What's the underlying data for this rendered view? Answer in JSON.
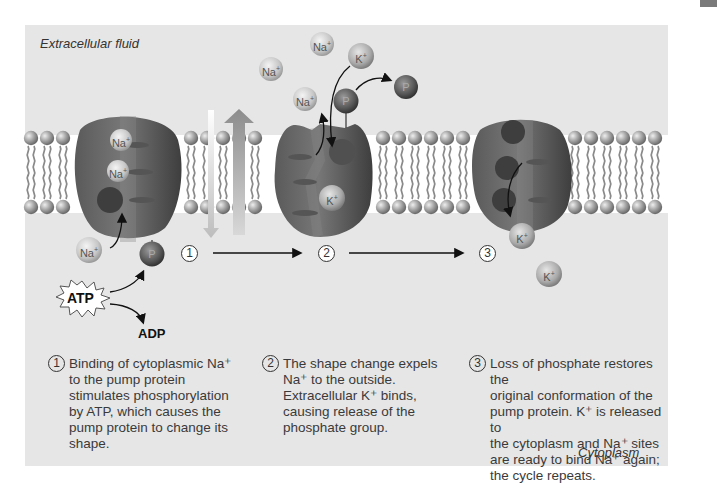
{
  "labels": {
    "extracellular": "Extracellular fluid",
    "cytoplasm": "Cytoplasm",
    "atp": "ATP",
    "adp": "ADP"
  },
  "markers": [
    "1",
    "2",
    "3"
  ],
  "ions": {
    "na": "Na",
    "k": "K",
    "plus": "+",
    "p": "P"
  },
  "steps": [
    {
      "number": "1",
      "text": "Binding of cytoplasmic Na⁺\nto the pump protein\nstimulates phosphorylation\nby ATP, which causes the\npump protein to change its\nshape."
    },
    {
      "number": "2",
      "text": "The shape change expels\nNa⁺ to the outside.\nExtracellular K⁺ binds,\ncausing release of the\nphosphate group."
    },
    {
      "number": "3",
      "text": "Loss of phosphate restores the\noriginal conformation of the\npump protein. K⁺ is released to\nthe cytoplasm and Na⁺ sites\nare ready to bind Na⁺ again;\nthe cycle repeats."
    }
  ],
  "colors": {
    "panel": "#e6e6e6",
    "membrane_band": "#ffffff",
    "lipid_head": "#9a9a9a",
    "protein": "#6a6a6a",
    "ion_light": "#c9c9c9",
    "phosphate": "#5a5a5a"
  }
}
